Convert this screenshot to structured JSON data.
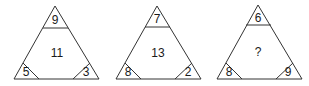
{
  "puzzle": {
    "triangles": [
      {
        "top": "9",
        "center": "11",
        "bottom_left": "5",
        "bottom_right": "3"
      },
      {
        "top": "7",
        "center": "13",
        "bottom_left": "8",
        "bottom_right": "2"
      },
      {
        "top": "6",
        "center": "?",
        "bottom_left": "8",
        "bottom_right": "9"
      }
    ]
  },
  "colors": {
    "line": "#333333",
    "text": "#1a1a1a",
    "background": "#ffffff"
  }
}
